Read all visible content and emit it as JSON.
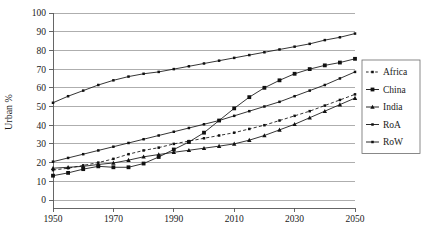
{
  "chart_data": {
    "type": "line",
    "title": "",
    "xlabel": "",
    "ylabel": "Urban %",
    "xlim": [
      1950,
      2050
    ],
    "ylim": [
      0,
      100
    ],
    "grid": true,
    "legend_position": "right",
    "x": [
      1950,
      1955,
      1960,
      1965,
      1970,
      1975,
      1980,
      1985,
      1990,
      1995,
      2000,
      2005,
      2010,
      2015,
      2020,
      2025,
      2030,
      2035,
      2040,
      2045,
      2050
    ],
    "xticks": [
      1950,
      1970,
      1990,
      2010,
      2030,
      2050
    ],
    "xticklabels": [
      "1950",
      "1970",
      "1990",
      "2010",
      "2030",
      "2050"
    ],
    "yticks": [
      0,
      10,
      20,
      30,
      40,
      50,
      60,
      70,
      80,
      90,
      100
    ],
    "yticklabels": [
      "0",
      "10",
      "20",
      "30",
      "40",
      "50",
      "60",
      "70",
      "80",
      "90",
      "100"
    ],
    "series": [
      {
        "name": "Africa",
        "marker": "dot",
        "linestyle": "dashed",
        "color": "#111111",
        "values": [
          16.0,
          17.0,
          18.5,
          20.0,
          22.0,
          24.5,
          26.5,
          28.0,
          30.0,
          31.5,
          33.0,
          34.5,
          36.0,
          38.0,
          40.0,
          42.5,
          45.0,
          47.5,
          50.5,
          53.5,
          56.5
        ]
      },
      {
        "name": "China",
        "marker": "square",
        "linestyle": "solid",
        "color": "#111111",
        "values": [
          13.0,
          14.5,
          16.5,
          18.0,
          17.5,
          17.5,
          19.5,
          23.0,
          27.0,
          31.0,
          36.0,
          42.5,
          49.0,
          55.0,
          60.0,
          64.0,
          67.5,
          70.0,
          72.0,
          73.5,
          75.5
        ]
      },
      {
        "name": "India",
        "marker": "triangle",
        "linestyle": "solid",
        "color": "#111111",
        "values": [
          17.0,
          17.5,
          18.0,
          19.0,
          19.8,
          21.3,
          23.1,
          24.3,
          25.5,
          26.6,
          27.7,
          28.8,
          30.0,
          32.0,
          34.5,
          37.5,
          40.5,
          44.0,
          47.5,
          51.0,
          54.5
        ]
      },
      {
        "name": "RoA",
        "marker": "dot",
        "linestyle": "solid",
        "color": "#111111",
        "values": [
          20.5,
          22.5,
          24.5,
          26.5,
          28.5,
          30.5,
          32.5,
          34.5,
          36.5,
          38.5,
          40.5,
          42.5,
          45.0,
          47.5,
          50.0,
          52.5,
          55.5,
          58.5,
          61.5,
          65.0,
          68.5
        ]
      },
      {
        "name": "RoW",
        "marker": "dot",
        "linestyle": "solid",
        "color": "#111111",
        "values": [
          52.0,
          55.5,
          58.5,
          61.5,
          64.0,
          66.0,
          67.5,
          68.5,
          70.0,
          71.5,
          73.0,
          74.5,
          76.0,
          77.5,
          79.0,
          80.5,
          82.0,
          83.5,
          85.5,
          87.0,
          89.0
        ]
      }
    ]
  },
  "legend": {
    "entries": [
      {
        "label": "Africa"
      },
      {
        "label": "China"
      },
      {
        "label": "India"
      },
      {
        "label": "RoA"
      },
      {
        "label": "RoW"
      }
    ]
  },
  "axes": {
    "y_axis_title": "Urban %"
  }
}
